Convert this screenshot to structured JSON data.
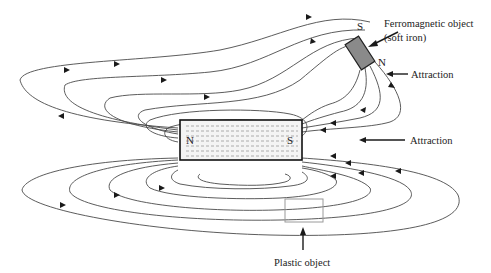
{
  "diagram": {
    "magnet": {
      "north_label": "N",
      "south_label": "S"
    },
    "iron_object": {
      "south_label": "S",
      "north_label": "N",
      "label_line1": "Ferromagnetic object",
      "label_line2": "(soft iron)",
      "attraction_label": "Attraction"
    },
    "magnet_attraction_label": "Attraction",
    "plastic_object": {
      "label": "Plastic object"
    },
    "colors": {
      "field_line": "#4a4a4a",
      "magnet_border": "#111111",
      "iron_fill": "#8a8a8a",
      "plastic_border": "#9a9a9a"
    }
  }
}
